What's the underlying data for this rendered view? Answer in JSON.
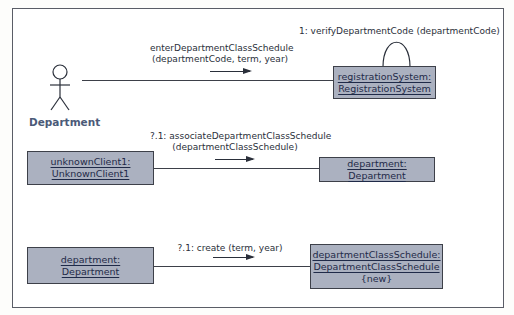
{
  "diagram": {
    "type": "UML communication diagram",
    "actor": {
      "label": "Department"
    },
    "objects": [
      {
        "id": "registrationSystem",
        "line1": "registrationSystem:",
        "line2": "RegistrationSystem",
        "line3": ""
      },
      {
        "id": "unknownClient1",
        "line1": "unknownClient1:",
        "line2": "UnknownClient1",
        "line3": ""
      },
      {
        "id": "department_target",
        "line1": "department: Department",
        "line2": "",
        "line3": ""
      },
      {
        "id": "department_source",
        "line1": "department:",
        "line2": "Department",
        "line3": ""
      },
      {
        "id": "departmentClassSchedule",
        "line1": "departmentClassSchedule:",
        "line2": "DepartmentClassSchedule",
        "line3": "{new}"
      }
    ],
    "messages": [
      {
        "line1": "enterDepartmentClassSchedule",
        "line2": "(departmentCode, term, year)",
        "from": "Department",
        "to": "registrationSystem"
      },
      {
        "line1": "1: verifyDepartmentCode (departmentCode)",
        "line2": "",
        "from": "registrationSystem",
        "to": "registrationSystem"
      },
      {
        "line1": "?.1: associateDepartmentClassSchedule",
        "line2": "(departmentClassSchedule)",
        "from": "unknownClient1",
        "to": "department_target"
      },
      {
        "line1": "?.1: create (term, year)",
        "line2": "",
        "from": "department_source",
        "to": "departmentClassSchedule"
      }
    ],
    "colors": {
      "object_fill": "#abb1c0",
      "object_border": "#3d4049",
      "actor_label": "#4b5a78",
      "frame_border": "#5a5d66"
    }
  }
}
